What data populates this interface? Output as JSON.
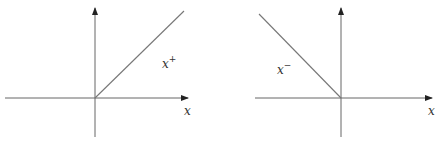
{
  "figure": {
    "left_panel": {
      "function_label": "x",
      "function_sup": "+",
      "axis_label": "x",
      "description": "positive part: zero for x<0, identity for x>=0"
    },
    "right_panel": {
      "function_label": "x",
      "function_sup": "−",
      "axis_label": "x",
      "description": "negative part: -x for x<0, zero for x>=0"
    },
    "colors": {
      "axis": "#555555",
      "curve": "#777777",
      "text": "#333333"
    }
  }
}
